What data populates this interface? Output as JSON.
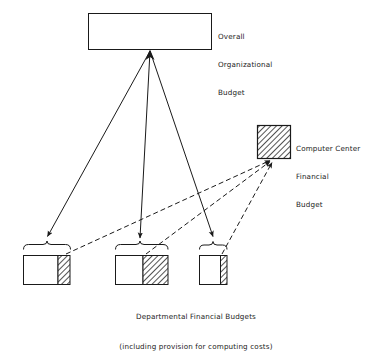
{
  "diagram": {
    "background_color": "#ffffff",
    "line_color": "#1a1a1a",
    "hatch_color": "#1a1a1a",
    "nodes": {
      "overall_budget": {
        "label_lines": [
          "Overall",
          "Organizational",
          "Budget"
        ],
        "line1": "Overall",
        "line2": "Organizational",
        "line3": "Budget",
        "fill": "white",
        "x": 88,
        "y": 13,
        "w": 124,
        "h": 37
      },
      "computer_center_budget": {
        "label_lines": [
          "Computer Center",
          "Financial",
          "Budget"
        ],
        "line1": "Computer Center",
        "line2": "Financial",
        "line3": "Budget",
        "fill": "hatched",
        "x": 257,
        "y": 125,
        "w": 34,
        "h": 34
      }
    },
    "departmental_boxes": [
      {
        "name": "departmental-budget-1",
        "x": 23,
        "y": 255,
        "w": 47,
        "h": 30,
        "hatch_x": 58,
        "hatch_w": 12
      },
      {
        "name": "departmental-budget-2",
        "x": 115,
        "y": 255,
        "w": 53,
        "h": 30,
        "hatch_x": 143,
        "hatch_w": 25
      },
      {
        "name": "departmental-budget-3",
        "x": 199,
        "y": 255,
        "w": 28,
        "h": 30,
        "hatch_x": 220,
        "hatch_w": 7
      }
    ],
    "braces": [
      {
        "name": "brace-1",
        "x1": 23,
        "x2": 70,
        "y": 248,
        "tip_x": 47
      },
      {
        "name": "brace-2",
        "x1": 115,
        "x2": 168,
        "y": 248,
        "tip_x": 141
      },
      {
        "name": "brace-3",
        "x1": 199,
        "x2": 227,
        "y": 248,
        "tip_x": 213
      }
    ],
    "solid_arrows": {
      "description": "allocation from overall organizational budget down to departmental financial budgets",
      "origin": {
        "x": 150,
        "y": 51
      },
      "targets": [
        {
          "x": 47,
          "y": 240
        },
        {
          "x": 140,
          "y": 242
        },
        {
          "x": 213,
          "y": 240
        }
      ],
      "style": "solid"
    },
    "dashed_arrows": {
      "description": "computing cost provisions flowing from departmental budgets to the computer center financial budget",
      "origins": [
        {
          "x": 66,
          "y": 254
        },
        {
          "x": 146,
          "y": 254
        },
        {
          "x": 222,
          "y": 254
        }
      ],
      "target": {
        "x": 273,
        "y": 159
      },
      "style": "dashed"
    },
    "caption": {
      "line1": "Departmental Financial Budgets",
      "line2": "(including provision for computing costs)"
    }
  }
}
